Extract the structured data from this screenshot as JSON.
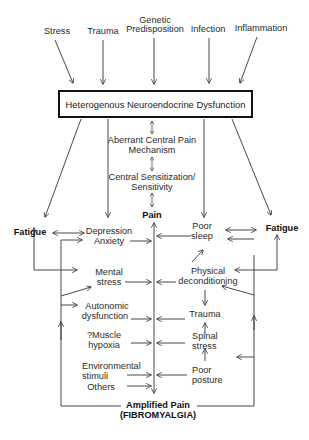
{
  "diagram": {
    "type": "flowchart",
    "causes": [
      {
        "id": "stress",
        "label": "Stress"
      },
      {
        "id": "trauma",
        "label": "Trauma"
      },
      {
        "id": "genetic",
        "line1": "Genetic",
        "line2": "Predisposition"
      },
      {
        "id": "infection",
        "label": "Infection"
      },
      {
        "id": "inflammation",
        "label": "Inflammation"
      }
    ],
    "central_box": {
      "label": "Heterogenous Neuroendocrine Dysfunction"
    },
    "central_chain": {
      "aberrant": {
        "line1": "Aberrant Central Pain",
        "line2": "Mechanism"
      },
      "sensitization": {
        "line1": "Central Sensitization/",
        "line2": "Sensitivity"
      },
      "pain": "Pain"
    },
    "fatigue_left": "Fatigue",
    "fatigue_right": "Fatigue",
    "left_factors": {
      "depression": {
        "line1": "Depression",
        "line2": "Anxiety"
      },
      "mental": {
        "line1": "Mental",
        "line2": "stress"
      },
      "autonomic": {
        "line1": "Autonomic",
        "line2": "dysfunction"
      },
      "muscle": {
        "line1": "?Muscle",
        "line2": "hypoxia"
      },
      "environmental": {
        "line1": "Environmental",
        "line2": "stimuli"
      },
      "others": "Others"
    },
    "right_factors": {
      "sleep": {
        "line1": "Poor",
        "line2": "sleep"
      },
      "deconditioning": {
        "line1": "Physical",
        "line2": "deconditioning"
      },
      "trauma": "Trauma",
      "spinal": {
        "line1": "Spinal",
        "line2": "stress"
      },
      "posture": {
        "line1": "Poor",
        "line2": "posture"
      }
    },
    "outcome": {
      "line1": "Amplified Pain",
      "line2": "(FIBROMYALGIA)"
    },
    "colors": {
      "line": "#333333",
      "box_border": "#111111",
      "background": "#ffffff"
    }
  }
}
